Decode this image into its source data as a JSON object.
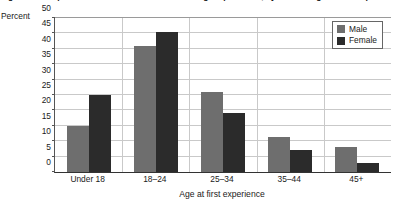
{
  "chart_data": {
    "type": "bar",
    "title": "Age at first experience of sexual intercourse among respondents, by sex and age at first experience",
    "xlabel": "Age at first experience",
    "ylabel": "Percent",
    "categories": [
      "Under 18",
      "18–24",
      "25–34",
      "35–44",
      "45+"
    ],
    "series": [
      {
        "name": "Male",
        "color": "#6e6e6e",
        "values": [
          15,
          41,
          26,
          11.5,
          8
        ]
      },
      {
        "name": "Female",
        "color": "#2b2b2b",
        "values": [
          25,
          45.5,
          19,
          7,
          3
        ]
      }
    ],
    "ylim": [
      0,
      50
    ],
    "yticks": [
      0,
      5,
      10,
      15,
      20,
      25,
      30,
      35,
      40,
      45,
      50
    ],
    "grid": true,
    "legend_position": "top-right"
  }
}
